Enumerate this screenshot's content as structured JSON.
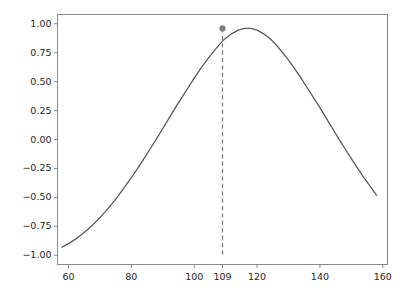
{
  "chart_data": {
    "type": "line",
    "title": "",
    "subtitle": "",
    "xlabel": "",
    "ylabel": "",
    "xlim": [
      56.5,
      161.5
    ],
    "ylim": [
      -1.08,
      1.08
    ],
    "grid": false,
    "legend": null,
    "x_ticks": [
      60,
      80,
      100,
      109,
      120,
      140,
      160
    ],
    "x_tick_labels": [
      "60",
      "80",
      "100",
      "109",
      "120",
      "140",
      "160"
    ],
    "y_ticks": [
      1.0,
      0.75,
      0.5,
      0.25,
      0.0,
      -0.25,
      -0.5,
      -0.75,
      -1.0
    ],
    "y_tick_labels": [
      "1.00",
      "0.75",
      "0.50",
      "0.25",
      "0.00",
      "−0.25",
      "−0.50",
      "−0.75",
      "−1.00"
    ],
    "series": [
      {
        "name": "curve",
        "type": "line",
        "color": "#5a5a5a",
        "linewidth": 1.3,
        "x": [
          58,
          60,
          62,
          64,
          66,
          68,
          70,
          72,
          74,
          76,
          78,
          80,
          82,
          84,
          86,
          88,
          90,
          92,
          94,
          96,
          98,
          100,
          102,
          104,
          106,
          108,
          109,
          110,
          112,
          114,
          116,
          118,
          120,
          122,
          124,
          126,
          128,
          130,
          132,
          134,
          136,
          138,
          140,
          142,
          144,
          146,
          148,
          150,
          152,
          154,
          156,
          158
        ],
        "y": [
          -0.93,
          -0.9,
          -0.865,
          -0.825,
          -0.78,
          -0.73,
          -0.675,
          -0.615,
          -0.55,
          -0.48,
          -0.405,
          -0.33,
          -0.25,
          -0.165,
          -0.08,
          0.005,
          0.095,
          0.185,
          0.275,
          0.36,
          0.445,
          0.53,
          0.61,
          0.685,
          0.755,
          0.82,
          0.85,
          0.875,
          0.915,
          0.945,
          0.96,
          0.96,
          0.945,
          0.915,
          0.875,
          0.82,
          0.755,
          0.685,
          0.61,
          0.53,
          0.445,
          0.36,
          0.275,
          0.185,
          0.095,
          0.005,
          -0.08,
          -0.165,
          -0.25,
          -0.33,
          -0.405,
          -0.48
        ]
      }
    ],
    "peak_marker": {
      "name": "peak-point",
      "x": 109,
      "y": 0.96,
      "color": "#808080",
      "size": 5
    },
    "vline": {
      "name": "peak-vertical-line",
      "x": 109,
      "y_start": 0.96,
      "y_end": -1.02,
      "color": "#808080",
      "style": "dashed",
      "linewidth": 1.3
    },
    "axes_color": "#8a8a8a",
    "tick_color": "#4d4d4d",
    "background": "#ffffff"
  }
}
